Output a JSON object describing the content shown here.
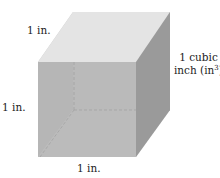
{
  "diagram": {
    "type": "unit-cube",
    "labels": {
      "top_edge": "1 in.",
      "left_edge": "1 in.",
      "bottom_edge": "1 in.",
      "volume_line1": "1 cubic",
      "volume_line2_prefix": "inch (in",
      "volume_exponent": "3",
      "volume_line2_suffix": ")"
    },
    "colors": {
      "front_face": "#bdbdbd",
      "top_face": "#e4e4e4",
      "right_face": "#9a9a9a",
      "back_face": "#d8d8d8",
      "bottom_face": "#dcdcdc",
      "hidden_edge": "#777777"
    }
  }
}
